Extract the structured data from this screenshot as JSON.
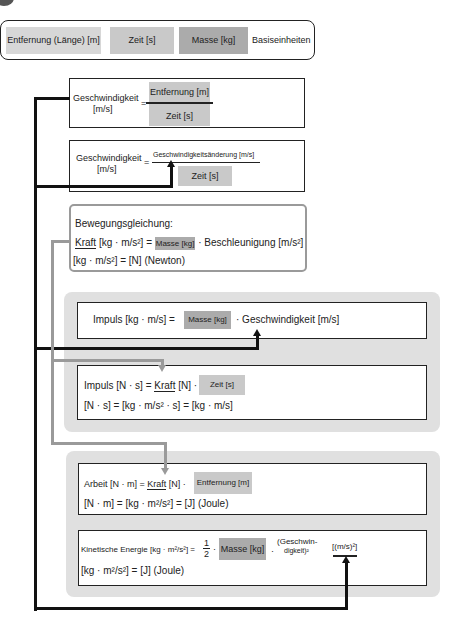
{
  "base_units": {
    "distance": "Entfernung (Länge) [m]",
    "time": "Zeit [s]",
    "mass": "Masse [kg]",
    "label": "Basiseinheiten"
  },
  "velocity1": {
    "lhs": "Geschwindigkeit",
    "lhs_unit": "[m/s]",
    "eq": "=",
    "numerator": "Entfernung [m]",
    "denominator": "Zeit [s]"
  },
  "velocity2": {
    "lhs": "Geschwindigkeit",
    "lhs_unit": "[m/s]",
    "eq": "=",
    "numerator": "Geschwindigkeitsänderung [m/s]",
    "denominator": "Zeit [s]"
  },
  "motion": {
    "title": "Bewegungsgleichung:",
    "force": "Kraft",
    "force_unit": " [kg · m/s²] = ",
    "mass": "Masse [kg]",
    "rest": " · Beschleunigung [m/s²]",
    "line2": "[kg · m/s²] = [N] (Newton)"
  },
  "impulse1": {
    "lhs": "Impuls [kg · m/s] = ",
    "mass": "Masse [kg]",
    "rest": " · Geschwindigkeit [m/s]"
  },
  "impulse2": {
    "lhs": "Impuls [N · s] = ",
    "force": "Kraft",
    "force_unit": " [N] · ",
    "time": "Zeit [s]",
    "line2": "[N · s] = [kg · m/s² · s] = [kg · m/s]"
  },
  "work": {
    "lhs": "Arbeit [N · m] = ",
    "force": "Kraft",
    "force_unit": " [N] · ",
    "distance": "Entfernung [m]",
    "line2": "[N · m] = [kg · m²/s²] = [J] (Joule)"
  },
  "kinetic": {
    "lhs": "Kinetische Energie [kg · m²/s²] =",
    "half_num": "1",
    "half_den": "2",
    "dot": "·",
    "mass": "Masse [kg]",
    "dot2": "·",
    "vel_line1": "(Geschwin-",
    "vel_line2": "digkeit)²",
    "unit": "[(m/s)²]",
    "line2": "[kg · m²/s²] = [J] (Joule)"
  },
  "colors": {
    "connector_black": "#111111",
    "connector_gray": "#9a9a9a",
    "panel_bg": "#e0e0e0",
    "highlight_light": "#d7d7d7",
    "highlight_mid": "#c9c9c9",
    "highlight_dark": "#ababab"
  }
}
